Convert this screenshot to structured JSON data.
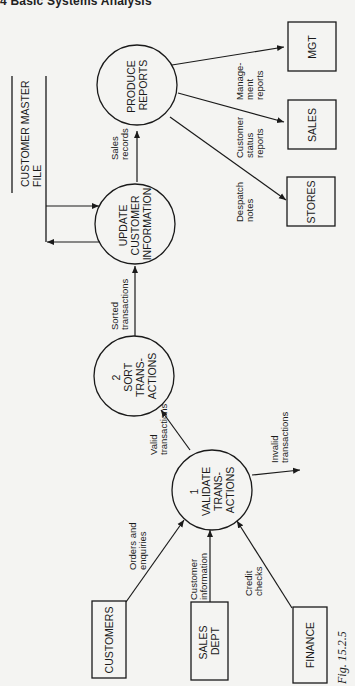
{
  "page": {
    "header": "4  Basic Systems Analysis",
    "figure_caption": "Fig. 15.2.5"
  },
  "processes": {
    "validate": {
      "number": "1",
      "lines": [
        "VALIDATE",
        "TRANS-",
        "ACTIONS"
      ]
    },
    "sort": {
      "number": "2",
      "lines": [
        "SORT",
        "TRANS-",
        "ACTIONS"
      ]
    },
    "update": {
      "lines": [
        "UPDATE",
        "CUSTOMER",
        "INFORMATION"
      ]
    },
    "produce": {
      "lines": [
        "PRODUCE",
        "REPORTS"
      ]
    }
  },
  "external_entities": {
    "customers": {
      "lines": [
        "CUSTOMERS"
      ]
    },
    "sales_dept": {
      "lines": [
        "SALES",
        "DEPT"
      ]
    },
    "finance": {
      "lines": [
        "FINANCE"
      ]
    },
    "stores": {
      "lines": [
        "STORES"
      ]
    },
    "sales": {
      "lines": [
        "SALES"
      ]
    },
    "mgt": {
      "lines": [
        "MGT"
      ]
    }
  },
  "data_store": {
    "lines": [
      "CUSTOMER MASTER",
      "FILE"
    ]
  },
  "flows": {
    "orders": [
      "Orders and",
      "enquiries"
    ],
    "customer_info": [
      "Customer",
      "information"
    ],
    "credit": [
      "Credit",
      "checks"
    ],
    "valid": [
      "Valid",
      "transactions"
    ],
    "invalid": [
      "Invalid",
      "transactions"
    ],
    "sorted": [
      "Sorted",
      "transactions"
    ],
    "sales_records": [
      "Sales",
      "records"
    ],
    "despatch": [
      "Despatch",
      "notes"
    ],
    "customer_status": [
      "Customer",
      "status",
      "reports"
    ],
    "management": [
      "Manage-",
      "ment",
      "reports"
    ]
  }
}
